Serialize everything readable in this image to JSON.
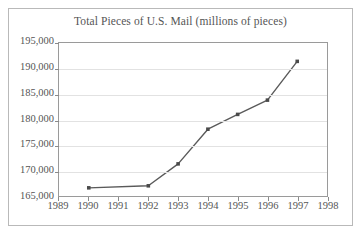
{
  "chart_data": {
    "type": "line",
    "title": "Total Pieces of U.S. Mail (millions of pieces)",
    "xlabel": "",
    "ylabel": "",
    "x": [
      1990,
      1992,
      1993,
      1994,
      1995,
      1996,
      1997
    ],
    "values": [
      166600,
      167000,
      171300,
      178100,
      181000,
      183800,
      191400
    ],
    "series": [
      {
        "name": "Total Pieces of U.S. Mail",
        "x": [
          1990,
          1992,
          1993,
          1994,
          1995,
          1996,
          1997
        ],
        "values": [
          166600,
          167000,
          171300,
          178100,
          181000,
          183800,
          191400
        ]
      }
    ],
    "xlim": [
      1989,
      1998
    ],
    "ylim": [
      165000,
      195000
    ],
    "x_ticks": [
      1989,
      1990,
      1991,
      1992,
      1993,
      1994,
      1995,
      1996,
      1997,
      1998
    ],
    "x_tick_labels": [
      "1989",
      "1990",
      "1991",
      "1992",
      "1993",
      "1994",
      "1995",
      "1996",
      "1997",
      "1998"
    ],
    "y_ticks": [
      165000,
      170000,
      175000,
      180000,
      185000,
      190000,
      195000
    ],
    "y_tick_labels": [
      "165,000",
      "170,000",
      "175,000",
      "180,000",
      "185,000",
      "190,000",
      "195,000"
    ],
    "grid": "horizontal",
    "legend": "none",
    "marker": "square",
    "line_color": "#5a5a5a",
    "marker_color": "#4a4a4a",
    "grid_color": "#e2e2e2",
    "axis_color": "#9a9a9a",
    "text_color": "#555555"
  }
}
